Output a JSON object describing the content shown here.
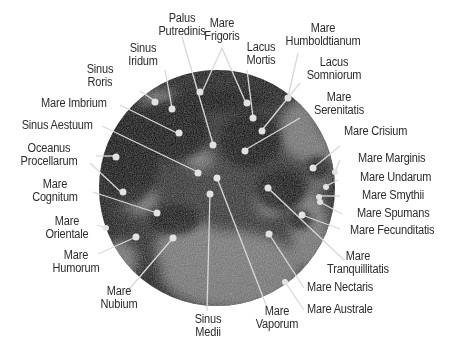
{
  "diagram": {
    "title": "",
    "colors": {
      "background": "#ffffff",
      "label_text": "#2b2b2b",
      "leader_line": "#d8d8d8",
      "marker_dot": "#e0e0e0",
      "moon_dark": "#1c1c1c",
      "moon_light": "#8a8a8a"
    },
    "labels": [
      {
        "id": "palus-putredinis",
        "lines": [
          "Palus",
          "Putredinis"
        ]
      },
      {
        "id": "mare-frigoris",
        "lines": [
          "Mare",
          "Frigoris"
        ]
      },
      {
        "id": "mare-humboldtianum",
        "lines": [
          "Mare",
          "Humboldtianum"
        ]
      },
      {
        "id": "sinus-iridum",
        "lines": [
          "Sinus",
          "Iridum"
        ]
      },
      {
        "id": "lacus-mortis",
        "lines": [
          "Lacus",
          "Mortis"
        ]
      },
      {
        "id": "lacus-somniorum",
        "lines": [
          "Lacus",
          "Somniorum"
        ]
      },
      {
        "id": "sinus-roris",
        "lines": [
          "Sinus",
          "Roris"
        ]
      },
      {
        "id": "mare-imbrium",
        "lines": [
          "Mare Imbrium"
        ]
      },
      {
        "id": "mare-serenitatis",
        "lines": [
          "Mare",
          "Serenitatis"
        ]
      },
      {
        "id": "sinus-aestuum",
        "lines": [
          "Sinus Aestuum"
        ]
      },
      {
        "id": "mare-crisium",
        "lines": [
          "Mare Crisium"
        ]
      },
      {
        "id": "oceanus-procellarum",
        "lines": [
          "Oceanus",
          "Procellarum"
        ]
      },
      {
        "id": "mare-marginis",
        "lines": [
          "Mare Marginis"
        ]
      },
      {
        "id": "mare-undarum",
        "lines": [
          "Mare Undarum"
        ]
      },
      {
        "id": "mare-cognitum",
        "lines": [
          "Mare",
          "Cognitum"
        ]
      },
      {
        "id": "mare-smythii",
        "lines": [
          "Mare Smythii"
        ]
      },
      {
        "id": "mare-spumans",
        "lines": [
          "Mare Spumans"
        ]
      },
      {
        "id": "mare-orientale",
        "lines": [
          "Mare",
          "Orientale"
        ]
      },
      {
        "id": "mare-fecunditatis",
        "lines": [
          "Mare Fecunditatis"
        ]
      },
      {
        "id": "mare-humorum",
        "lines": [
          "Mare",
          "Humorum"
        ]
      },
      {
        "id": "mare-tranquillitatis",
        "lines": [
          "Mare",
          "Tranquillitatis"
        ]
      },
      {
        "id": "mare-nectaris",
        "lines": [
          "Mare Nectaris"
        ]
      },
      {
        "id": "mare-nubium",
        "lines": [
          "Mare",
          "Nubium"
        ]
      },
      {
        "id": "mare-australe",
        "lines": [
          "Mare Australe"
        ]
      },
      {
        "id": "sinus-medii",
        "lines": [
          "Sinus",
          "Medii"
        ]
      },
      {
        "id": "mare-vaporum",
        "lines": [
          "Mare",
          "Vaporum"
        ]
      }
    ]
  }
}
